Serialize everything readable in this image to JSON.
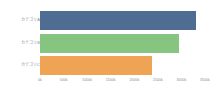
{
  "chart_data": {
    "type": "bar",
    "orientation": "horizontal",
    "title": "",
    "subtitle": "",
    "xlabel": "",
    "ylabel": "",
    "grid": false,
    "legend": false,
    "legend_position": "none",
    "categories": [
      "カテゴリA",
      "カテゴリB",
      "カテゴリC"
    ],
    "values": [
      3300,
      2950,
      2380
    ],
    "value_unit": "k",
    "xlim": [
      0,
      3500
    ],
    "xticks": [
      0,
      500,
      1000,
      1500,
      2000,
      2500,
      3000,
      3500
    ],
    "xtick_labels": [
      "0k",
      "500k",
      "1000k",
      "1500k",
      "2000k",
      "2500k",
      "3000k",
      "3500k"
    ],
    "bar_colors": [
      "#4f6d92",
      "#86c580",
      "#efa455"
    ],
    "series": [
      {
        "name": "値",
        "values": [
          3300,
          2950,
          2380
        ]
      }
    ],
    "bars": [
      {
        "category": "カテゴリA",
        "value": 3300,
        "color": "#4f6d92"
      },
      {
        "category": "カテゴリB",
        "value": 2950,
        "color": "#86c580"
      },
      {
        "category": "カテゴリC",
        "value": 2380,
        "color": "#efa455"
      }
    ]
  },
  "axis_text_color": "#8a8a8a",
  "background_color": "#ffffff"
}
